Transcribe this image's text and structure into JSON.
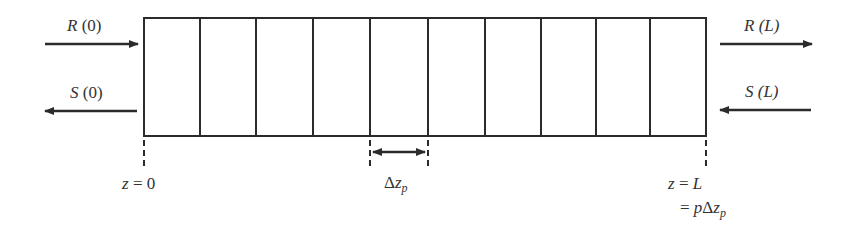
{
  "diagram": {
    "type": "segmented-medium",
    "segments": 10,
    "box": {
      "left": 144,
      "top": 18,
      "right": 706,
      "bottom": 136
    },
    "dividers_x": [
      200,
      256,
      313,
      370,
      428,
      485,
      541,
      596,
      650
    ],
    "stroke_color": "#2b2b2b",
    "left_inputs": {
      "forward": {
        "symbol": "R",
        "arg": "(0)",
        "direction": "right"
      },
      "backward": {
        "symbol": "S",
        "arg": "(0)",
        "direction": "left"
      }
    },
    "right_outputs": {
      "forward": {
        "symbol": "R",
        "arg": "(L)",
        "direction": "right"
      },
      "backward": {
        "symbol": "S",
        "arg": "(L)",
        "direction": "left"
      }
    },
    "labels": {
      "z_start": {
        "var": "z",
        "eq": " = ",
        "val": "0"
      },
      "z_end": {
        "var": "z",
        "eq": " = ",
        "val": "L"
      },
      "z_end_line2": {
        "eq": "= ",
        "p": "p",
        "delta": "Δ",
        "z": "z",
        "sub": "p"
      },
      "segment_width": {
        "delta": "Δ",
        "z": "z",
        "sub": "p"
      }
    }
  }
}
